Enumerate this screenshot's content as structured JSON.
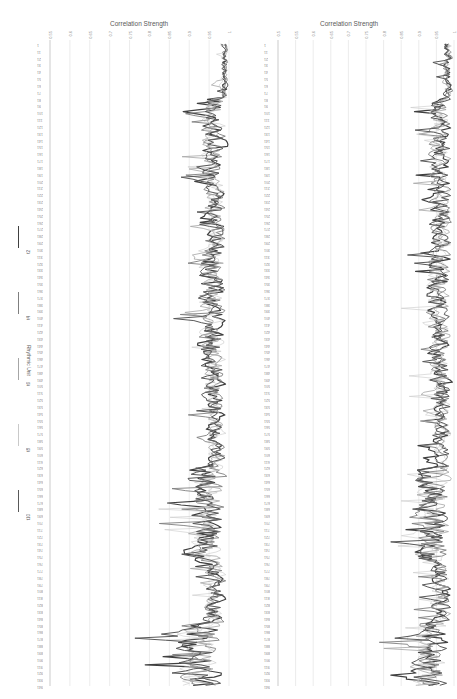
{
  "chart_data": [
    {
      "type": "line",
      "orientation": "rotated (values on horizontal axis, categories on vertical axis)",
      "title": "Correlation Strength",
      "xlabel": "Correlation Strength",
      "ylabel": "Rhythmic Unit",
      "x_ticks": [
        "1",
        "0.95",
        "0.9",
        "0.85",
        "0.8",
        "0.75",
        "0.7",
        "0.65",
        "0.6",
        "0.55"
      ],
      "xlim": [
        0.55,
        1.0
      ],
      "y_categories_range": [
        1,
        941
      ],
      "y_tick_step": 10,
      "grid": true,
      "legend_position": "left",
      "series": [
        {
          "name": "t2",
          "color": "#404040",
          "width": 1.2
        },
        {
          "name": "t4",
          "color": "#7f7f7f",
          "width": 0.9
        },
        {
          "name": "t6",
          "color": "#a6a6a6",
          "width": 0.8
        },
        {
          "name": "t8",
          "color": "#c9c9c9",
          "width": 0.6
        },
        {
          "name": "t10",
          "color": "#595959",
          "width": 1.0
        }
      ],
      "envelope_min_by_region": [
        {
          "from": 1,
          "to": 80,
          "min": 0.95
        },
        {
          "from": 80,
          "to": 200,
          "min": 0.83
        },
        {
          "from": 200,
          "to": 300,
          "min": 0.85
        },
        {
          "from": 300,
          "to": 400,
          "min": 0.8
        },
        {
          "from": 400,
          "to": 520,
          "min": 0.82
        },
        {
          "from": 520,
          "to": 620,
          "min": 0.86
        },
        {
          "from": 620,
          "to": 760,
          "min": 0.75
        },
        {
          "from": 760,
          "to": 850,
          "min": 0.85
        },
        {
          "from": 850,
          "to": 941,
          "min": 0.68
        }
      ]
    },
    {
      "type": "line",
      "orientation": "rotated (values on horizontal axis, categories on vertical axis)",
      "title": "Correlation Strength",
      "xlabel": "Correlation Strength",
      "ylabel": "Rhythmic Unit",
      "x_ticks": [
        "1",
        "0.95",
        "0.9",
        "0.85",
        "0.8",
        "0.75",
        "0.7",
        "0.65",
        "0.6",
        "0.55",
        "0.5"
      ],
      "xlim": [
        0.5,
        1.0
      ],
      "y_categories_range": [
        1,
        941
      ],
      "y_tick_step": 10,
      "grid": true,
      "series": [
        {
          "name": "t2",
          "color": "#404040",
          "width": 1.2
        },
        {
          "name": "t4",
          "color": "#7f7f7f",
          "width": 0.9
        },
        {
          "name": "t6",
          "color": "#a6a6a6",
          "width": 0.8
        },
        {
          "name": "t8",
          "color": "#c9c9c9",
          "width": 0.6
        },
        {
          "name": "t10",
          "color": "#595959",
          "width": 1.0
        }
      ],
      "envelope_min_by_region": [
        {
          "from": 1,
          "to": 80,
          "min": 0.92
        },
        {
          "from": 80,
          "to": 200,
          "min": 0.83
        },
        {
          "from": 200,
          "to": 300,
          "min": 0.83
        },
        {
          "from": 300,
          "to": 400,
          "min": 0.8
        },
        {
          "from": 400,
          "to": 520,
          "min": 0.82
        },
        {
          "from": 520,
          "to": 620,
          "min": 0.86
        },
        {
          "from": 620,
          "to": 760,
          "min": 0.72
        },
        {
          "from": 760,
          "to": 850,
          "min": 0.84
        },
        {
          "from": 850,
          "to": 941,
          "min": 0.68
        }
      ]
    }
  ],
  "legend": {
    "title": "Rhythmic Unit",
    "items": [
      {
        "label": "t2",
        "color": "#404040",
        "width": 1.6
      },
      {
        "label": "t4",
        "color": "#7f7f7f",
        "width": 1.2
      },
      {
        "label": "t6",
        "color": "#a6a6a6",
        "width": 1.0
      },
      {
        "label": "t8",
        "color": "#c9c9c9",
        "width": 0.8
      },
      {
        "label": "t10",
        "color": "#595959",
        "width": 1.4
      }
    ]
  },
  "charts": [
    {
      "title": "Correlation Strength"
    },
    {
      "title": "Correlation Strength"
    }
  ]
}
